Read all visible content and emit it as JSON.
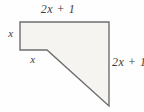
{
  "figure": {
    "labels": {
      "top_side": "2x + 1",
      "left_side": "x",
      "notch_side": "x",
      "right_side": "2x + 1"
    },
    "colors": {
      "outline": "#6e6e6e",
      "fill": "#f5f4f1",
      "background": "#fefefe",
      "text": "#3d3d3d"
    }
  }
}
